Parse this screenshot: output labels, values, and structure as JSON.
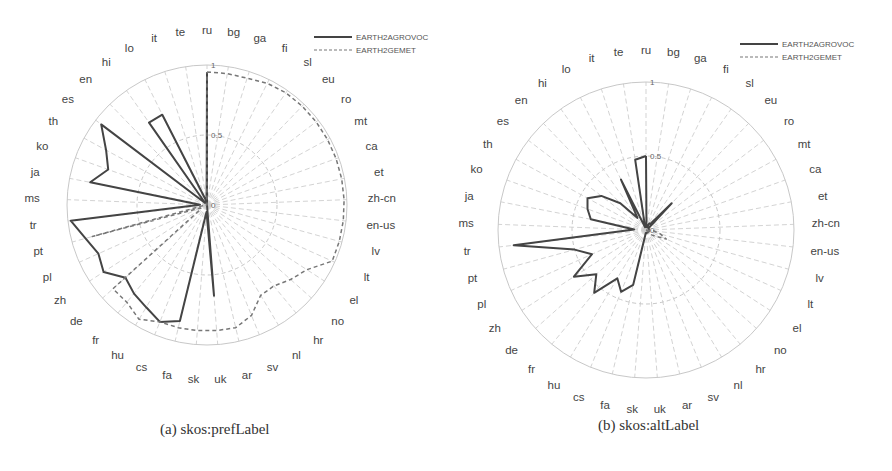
{
  "figure": {
    "panels": [
      {
        "id": "a",
        "caption": "(a) skos:prefLabel"
      },
      {
        "id": "b",
        "caption": "(b) skos:altLabel"
      }
    ]
  },
  "legend": {
    "series_1": "EARTH2AGROVOC",
    "series_2": "EARTH2GEMET"
  },
  "colors": {
    "agrovoc": "#444444",
    "gemet": "#777777",
    "grid": "#c8c8c8"
  },
  "chart_data": [
    {
      "type": "radar",
      "title": "(a) skos:prefLabel",
      "categories": [
        "ru",
        "bg",
        "ga",
        "fi",
        "sl",
        "eu",
        "ro",
        "mt",
        "ca",
        "et",
        "zh-cn",
        "en-us",
        "lv",
        "lt",
        "el",
        "no",
        "hr",
        "nl",
        "sv",
        "ar",
        "uk",
        "sk",
        "fa",
        "cs",
        "hu",
        "fr",
        "de",
        "zh",
        "pl",
        "pt",
        "tr",
        "ms",
        "ja",
        "ko",
        "th",
        "es",
        "en",
        "hi",
        "lo",
        "it",
        "te"
      ],
      "rlim": [
        0,
        1
      ],
      "rticks": [
        0,
        0.5,
        1
      ],
      "legend_position": "upper right",
      "series": [
        {
          "name": "EARTH2AGROVOC",
          "style": "solid",
          "values": [
            0.95,
            0,
            0,
            0,
            0,
            0,
            0,
            0,
            0,
            0,
            0,
            0,
            0,
            0,
            0,
            0,
            0,
            0,
            0,
            0,
            0.65,
            0.05,
            0.85,
            0.9,
            0.85,
            0.82,
            0.78,
            0.88,
            0.85,
            0.9,
            0.98,
            0.05,
            0.85,
            0.75,
            0.82,
            0.95,
            0.02,
            0.72,
            0.72,
            0.05,
            0.02
          ]
        },
        {
          "name": "EARTH2GEMET",
          "style": "dashed",
          "values": [
            0.95,
            0.95,
            0.95,
            0.97,
            0.98,
            0.98,
            0.98,
            0.98,
            0.98,
            0.98,
            0.98,
            0.98,
            0.98,
            0.98,
            0.85,
            0.8,
            0.75,
            0.75,
            0.85,
            0.9,
            0.9,
            0.9,
            0.9,
            0.9,
            0.95,
            0.9,
            0.9,
            0.05,
            0.05,
            0.85,
            0.02,
            0.02,
            0,
            0,
            0,
            0,
            0,
            0,
            0,
            0,
            0
          ]
        }
      ]
    },
    {
      "type": "radar",
      "title": "(b) skos:altLabel",
      "categories": [
        "ru",
        "bg",
        "ga",
        "fi",
        "sl",
        "eu",
        "ro",
        "mt",
        "ca",
        "et",
        "zh-cn",
        "en-us",
        "lv",
        "lt",
        "el",
        "no",
        "hr",
        "nl",
        "sv",
        "ar",
        "uk",
        "sk",
        "fa",
        "cs",
        "hu",
        "fr",
        "de",
        "zh",
        "pl",
        "pt",
        "tr",
        "ms",
        "ja",
        "ko",
        "th",
        "es",
        "en",
        "hi",
        "lo",
        "it",
        "te"
      ],
      "rlim": [
        0,
        1
      ],
      "rticks": [
        0,
        0.5,
        1
      ],
      "legend_position": "upper right",
      "series": [
        {
          "name": "EARTH2AGROVOC",
          "style": "solid",
          "values": [
            0.5,
            0.02,
            0.02,
            0.05,
            0.05,
            0.25,
            0.02,
            0.02,
            0.02,
            0.02,
            0.02,
            0.02,
            0.02,
            0.02,
            0.02,
            0.02,
            0.02,
            0.02,
            0.02,
            0.02,
            0.02,
            0.02,
            0.38,
            0.45,
            0.38,
            0.55,
            0.45,
            0.58,
            0.4,
            0.5,
            0.9,
            0.08,
            0.38,
            0.42,
            0.45,
            0.38,
            0.25,
            0.1,
            0.38,
            0.02,
            0.48
          ]
        },
        {
          "name": "EARTH2GEMET",
          "style": "dashed",
          "values": [
            0,
            0,
            0,
            0,
            0,
            0,
            0,
            0,
            0,
            0,
            0,
            0.05,
            0.1,
            0.15,
            0.08,
            0.05,
            0,
            0,
            0,
            0,
            0,
            0,
            0,
            0,
            0,
            0,
            0,
            0,
            0,
            0,
            0,
            0,
            0,
            0,
            0,
            0,
            0,
            0,
            0,
            0,
            0
          ]
        }
      ]
    }
  ]
}
